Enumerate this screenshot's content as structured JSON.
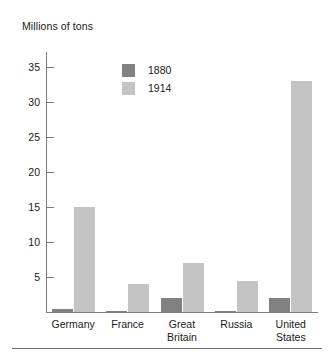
{
  "chart_data": {
    "type": "bar",
    "title": "Millions of tons",
    "xlabel": "",
    "ylabel": "Millions of tons",
    "ylim": [
      0,
      36.5
    ],
    "yticks": [
      5,
      10,
      15,
      20,
      25,
      30,
      35
    ],
    "ytick_labels": [
      "5",
      "10",
      "15",
      "20",
      "25",
      "30",
      "35"
    ],
    "grid": false,
    "legend_position": "upper-center-left",
    "categories": [
      "Germany",
      "France",
      "Great Britain",
      "Russia",
      "United States"
    ],
    "series": [
      {
        "name": "1880",
        "color": "#818181",
        "values": [
          0.5,
          0.1,
          2,
          0.2,
          2
        ]
      },
      {
        "name": "1914",
        "color": "#c4c4c4",
        "values": [
          15,
          4,
          7,
          4.5,
          33
        ]
      }
    ]
  },
  "legend": {
    "items": [
      {
        "label": "1880"
      },
      {
        "label": "1914"
      }
    ]
  },
  "colors": {
    "series_1880": "#818181",
    "series_1914": "#c4c4c4",
    "axis": "#7d7d7d",
    "rule": "#6f6f6f",
    "text": "#1a1a1a",
    "background": "#ffffff"
  }
}
